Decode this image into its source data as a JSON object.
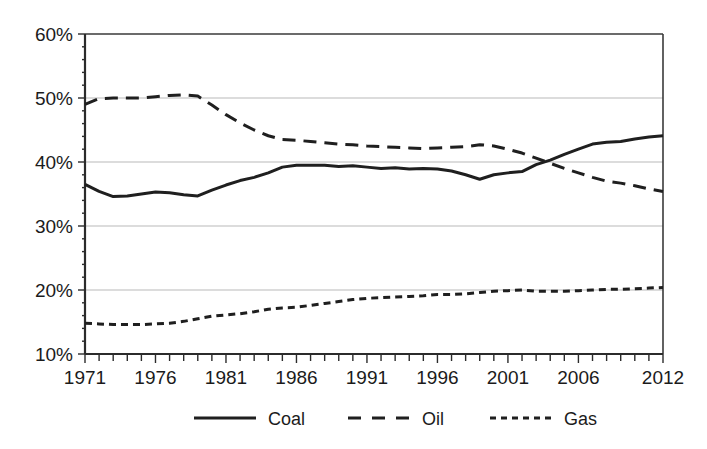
{
  "chart_data": {
    "type": "line",
    "title": "",
    "subtitle": "",
    "xlabel": "",
    "ylabel": "",
    "xlim": [
      1971,
      2012
    ],
    "ylim": [
      10,
      60
    ],
    "y_tick_labels": [
      "10%",
      "20%",
      "30%",
      "40%",
      "50%",
      "60%"
    ],
    "y_ticks": [
      10,
      20,
      30,
      40,
      50,
      60
    ],
    "x_tick_labels": [
      "1971",
      "1976",
      "1981",
      "1986",
      "1991",
      "1996",
      "2001",
      "2006",
      "2012"
    ],
    "x_ticks": [
      1971,
      1976,
      1981,
      1986,
      1991,
      1996,
      2001,
      2006,
      2012
    ],
    "x_minor_tick_interval": 1,
    "grid": "horizontal",
    "legend_position": "bottom",
    "legend": [
      "Coal",
      "Oil",
      "Gas"
    ],
    "x": [
      1971,
      1972,
      1973,
      1974,
      1975,
      1976,
      1977,
      1978,
      1979,
      1980,
      1981,
      1982,
      1983,
      1984,
      1985,
      1986,
      1987,
      1988,
      1989,
      1990,
      1991,
      1992,
      1993,
      1994,
      1995,
      1996,
      1997,
      1998,
      1999,
      2000,
      2001,
      2002,
      2003,
      2004,
      2005,
      2006,
      2007,
      2008,
      2009,
      2010,
      2011,
      2012
    ],
    "series": [
      {
        "name": "Coal",
        "style": "solid",
        "color": "#1f1f1f",
        "values": [
          36.5,
          35.4,
          34.6,
          34.7,
          35.0,
          35.3,
          35.2,
          34.9,
          34.7,
          35.6,
          36.4,
          37.1,
          37.6,
          38.3,
          39.2,
          39.5,
          39.5,
          39.5,
          39.3,
          39.4,
          39.2,
          39.0,
          39.1,
          38.9,
          39.0,
          38.9,
          38.6,
          38.0,
          37.3,
          38.0,
          38.3,
          38.5,
          39.6,
          40.3,
          41.2,
          42.0,
          42.8,
          43.1,
          43.2,
          43.6,
          43.9,
          44.1
        ]
      },
      {
        "name": "Oil",
        "style": "long-dash",
        "color": "#1f1f1f",
        "values": [
          49.0,
          49.9,
          50.0,
          50.0,
          50.0,
          50.2,
          50.4,
          50.5,
          50.3,
          48.9,
          47.4,
          46.1,
          45.0,
          44.1,
          43.5,
          43.4,
          43.2,
          43.0,
          42.8,
          42.7,
          42.5,
          42.4,
          42.3,
          42.2,
          42.1,
          42.2,
          42.3,
          42.4,
          42.7,
          42.5,
          42.0,
          41.4,
          40.6,
          39.8,
          39.0,
          38.3,
          37.6,
          37.0,
          36.7,
          36.3,
          35.8,
          35.4
        ]
      },
      {
        "name": "Gas",
        "style": "short-dash",
        "color": "#1f1f1f",
        "values": [
          14.8,
          14.7,
          14.6,
          14.6,
          14.6,
          14.7,
          14.8,
          15.1,
          15.5,
          15.9,
          16.1,
          16.3,
          16.6,
          17.0,
          17.2,
          17.3,
          17.6,
          17.9,
          18.2,
          18.5,
          18.7,
          18.8,
          18.9,
          19.0,
          19.1,
          19.3,
          19.3,
          19.4,
          19.6,
          19.8,
          19.9,
          20.0,
          19.8,
          19.8,
          19.8,
          19.9,
          20.0,
          20.1,
          20.1,
          20.2,
          20.3,
          20.4
        ]
      }
    ]
  },
  "legend": {
    "items": [
      {
        "label": "Coal",
        "style": "solid"
      },
      {
        "label": "Oil",
        "style": "long-dash"
      },
      {
        "label": "Gas",
        "style": "short-dash"
      }
    ]
  },
  "axes": {
    "y_labels": [
      "60%",
      "50%",
      "40%",
      "30%",
      "20%",
      "10%"
    ],
    "x_labels": [
      "1971",
      "1976",
      "1981",
      "1986",
      "1991",
      "1996",
      "2001",
      "2006",
      "2012"
    ]
  },
  "colors": {
    "series_stroke": "#1f1f1f",
    "gridline": "#b9b9b9",
    "axis": "#2b2b2b",
    "background": "#ffffff",
    "text": "#1b1b1b"
  }
}
